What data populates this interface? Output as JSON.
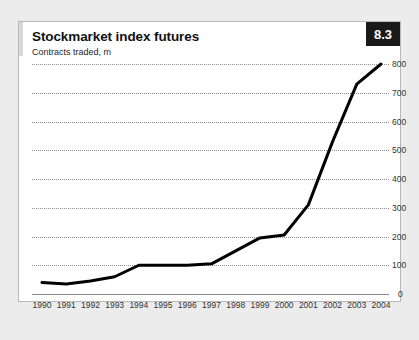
{
  "card": {
    "title": "Stockmarket index futures",
    "subtitle": "Contracts traded, m",
    "badge": "8.3",
    "badge_bg": "#1a1a1a",
    "badge_color": "#ffffff",
    "background": "#ffffff",
    "border_color": "#b9b9b9",
    "page_background": "#ececec"
  },
  "chart_data": {
    "type": "line",
    "title": "Stockmarket index futures",
    "subtitle": "Contracts traded, m",
    "xlabel": "",
    "ylabel": "Contracts traded, m",
    "categories": [
      "1990",
      "1991",
      "1992",
      "1993",
      "1994",
      "1995",
      "1996",
      "1997",
      "1998",
      "1999",
      "2000",
      "2001",
      "2002",
      "2003",
      "2004"
    ],
    "values": [
      40,
      35,
      45,
      60,
      100,
      100,
      100,
      105,
      150,
      195,
      205,
      310,
      530,
      730,
      800
    ],
    "ylim": [
      0,
      800
    ],
    "yticks": [
      0,
      100,
      200,
      300,
      400,
      500,
      600,
      700,
      800
    ],
    "ytick_labels": [
      "0",
      "100",
      "200",
      "300",
      "400",
      "500",
      "600",
      "700",
      "800"
    ],
    "grid": true,
    "grid_style": "dotted",
    "grid_color": "#8d8d8d",
    "legend": false,
    "legend_position": "none",
    "series_color": "#000000",
    "line_width": 3,
    "y_axis_side": "right"
  }
}
